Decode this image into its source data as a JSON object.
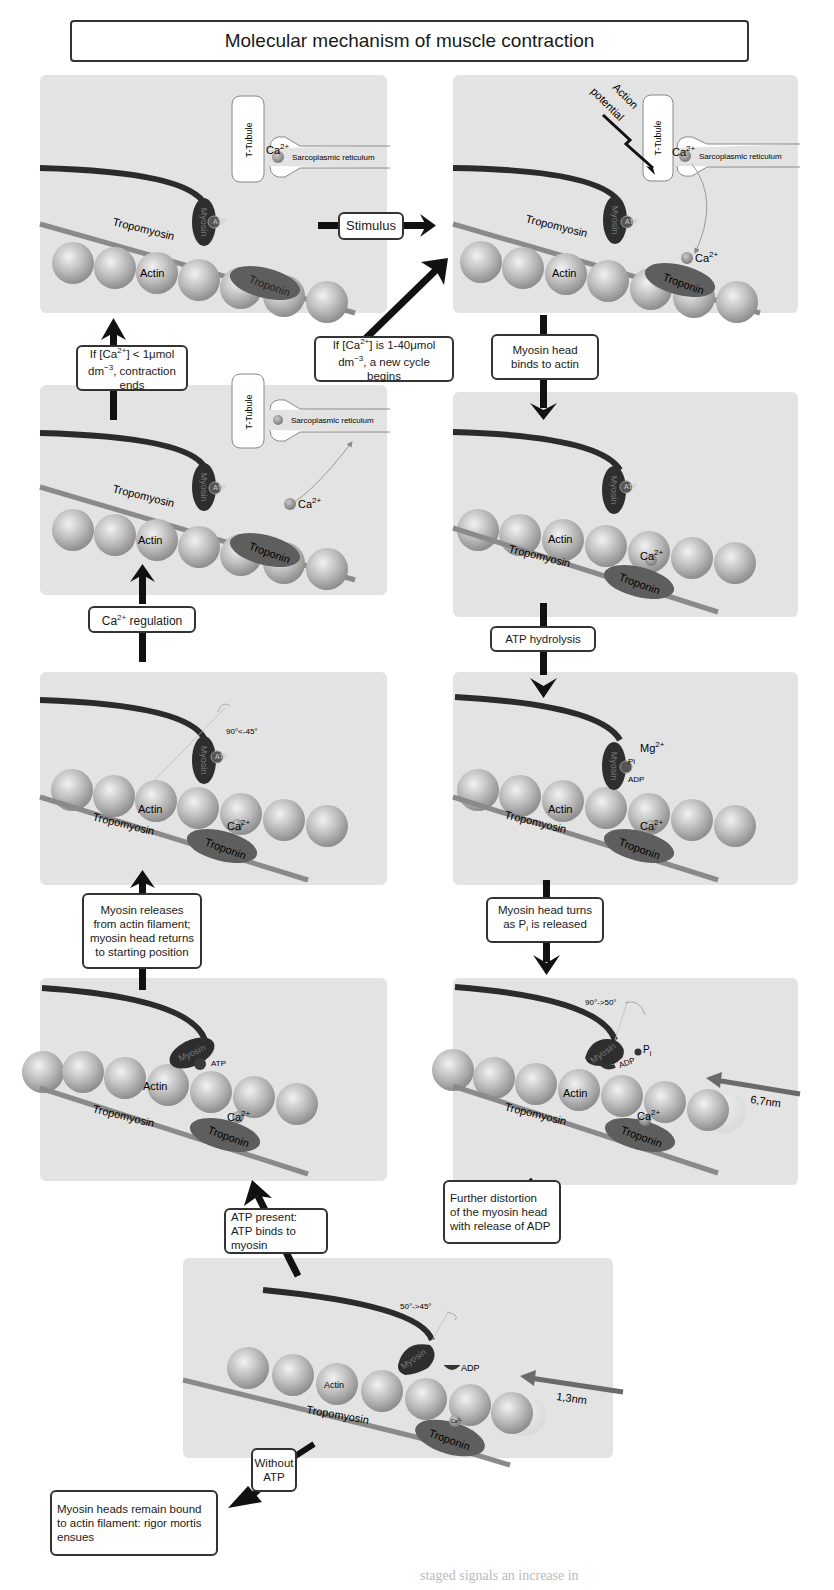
{
  "title": "Molecular mechanism of muscle contraction",
  "colors": {
    "panel_bg": "#e3e3e3",
    "actin": "#b5b5b5",
    "myosin": "#2e2e2e",
    "troponin": "#5e5e5e",
    "tropomyosin": "#8a8a8a",
    "arrow": "#111111",
    "calcium": "#8f8f8f"
  },
  "panels": [
    {
      "id": "resting",
      "labels": {
        "t_tubule": "T-Tubule",
        "sr": "Sarcoplasmic reticulum",
        "ca": "Ca",
        "ca_sup": "2+",
        "tropomyosin": "Tropomyosin",
        "myosin": "Myosin",
        "atp": "ATP",
        "actin": "Actin",
        "troponin": "Troponin"
      }
    },
    {
      "id": "stimulated",
      "labels": {
        "action_potential_1": "Action",
        "action_potential_2": "potential",
        "t_tubule": "T-Tubule",
        "sr": "Sarcoplasmic reticulum",
        "ca": "Ca",
        "ca_sup": "2+",
        "tropomyosin": "Tropomyosin",
        "myosin": "Myosin",
        "atp": "ATP",
        "actin": "Actin",
        "troponin": "Troponin",
        "ca_bound": "Ca",
        "ca_bound_sup": "2+"
      }
    },
    {
      "id": "relaxing",
      "labels": {
        "t_tubule": "T-Tubule",
        "sr": "Sarcoplasmic reticulum",
        "ca": "Ca",
        "ca_sup": "2+",
        "tropomyosin": "Tropomyosin",
        "myosin": "Myosin",
        "atp": "ATP",
        "actin": "Actin",
        "troponin": "Troponin"
      }
    },
    {
      "id": "binding",
      "labels": {
        "myosin": "Myosin",
        "atp": "ATP",
        "actin": "Actin",
        "tropomyosin": "Tropomyosin",
        "troponin": "Troponin",
        "ca": "Ca",
        "ca_sup": "2+"
      }
    },
    {
      "id": "recovery-stroke",
      "labels": {
        "angle": "90°<-45°",
        "myosin": "Myosin",
        "atp": "ATP",
        "actin": "Actin",
        "tropomyosin": "Tropomyosin",
        "troponin": "Troponin",
        "ca": "Ca",
        "ca_sup": "2+"
      }
    },
    {
      "id": "hydrolysis",
      "labels": {
        "myosin": "Myosin",
        "mg": "Mg",
        "mg_sup": "2+",
        "pi": "Pi",
        "adp": "ADP",
        "actin": "Actin",
        "tropomyosin": "Tropomyosin",
        "troponin": "Troponin",
        "ca": "Ca",
        "ca_sup": "2+"
      }
    },
    {
      "id": "release",
      "labels": {
        "myosin": "Myosin",
        "atp": "ATP",
        "actin": "Actin",
        "tropomyosin": "Tropomyosin",
        "troponin": "Troponin",
        "ca": "Ca",
        "ca_sup": "2+"
      }
    },
    {
      "id": "power-stroke",
      "labels": {
        "angle": "90°->50°",
        "myosin": "Myosin",
        "pi": "P",
        "pi_sub": "i",
        "adp": "ADP",
        "actin": "Actin",
        "tropomyosin": "Tropomyosin",
        "troponin": "Troponin",
        "ca": "Ca",
        "ca_sup": "2+",
        "distance": "6,7nm"
      }
    },
    {
      "id": "adp-release",
      "labels": {
        "angle": "50°->45°",
        "myosin": "Myosin",
        "adp": "ADP",
        "actin": "Actin",
        "tropomyosin": "Tropomyosin",
        "troponin": "Troponin",
        "ca": "Ca",
        "ca_sup": "2+",
        "distance": "1,3nm"
      }
    }
  ],
  "steps": {
    "stimulus": "Stimulus",
    "myosin_binds": [
      "Myosin head",
      "binds to actin"
    ],
    "atp_hydrolysis": "ATP hydrolysis",
    "pi_release": [
      "Myosin head turns",
      "as P",
      "i",
      " is released"
    ],
    "adp_release": [
      "Further distortion",
      "of the myosin head",
      "with release of ADP"
    ],
    "atp_binds": [
      "ATP present:",
      "ATP binds to",
      "myosin"
    ],
    "myosin_releases": [
      "Myosin releases",
      "from actin filament;",
      "myosin head returns",
      "to starting position"
    ],
    "ca_regulation": [
      "Ca",
      "2+",
      " regulation"
    ],
    "contraction_ends": [
      "If [Ca",
      "2+",
      "] < 1μmol",
      "dm",
      "−3",
      ", contraction ends"
    ],
    "new_cycle": [
      "If [Ca",
      "2+",
      "] is 1-40μmol",
      "dm",
      "−3",
      ", a new cycle begins"
    ],
    "without_atp": [
      "Without",
      "ATP"
    ],
    "rigor_mortis": [
      "Myosin heads remain bound",
      "to actin filament: rigor mortis",
      "ensues"
    ]
  },
  "caption": "staged signals an increase in"
}
